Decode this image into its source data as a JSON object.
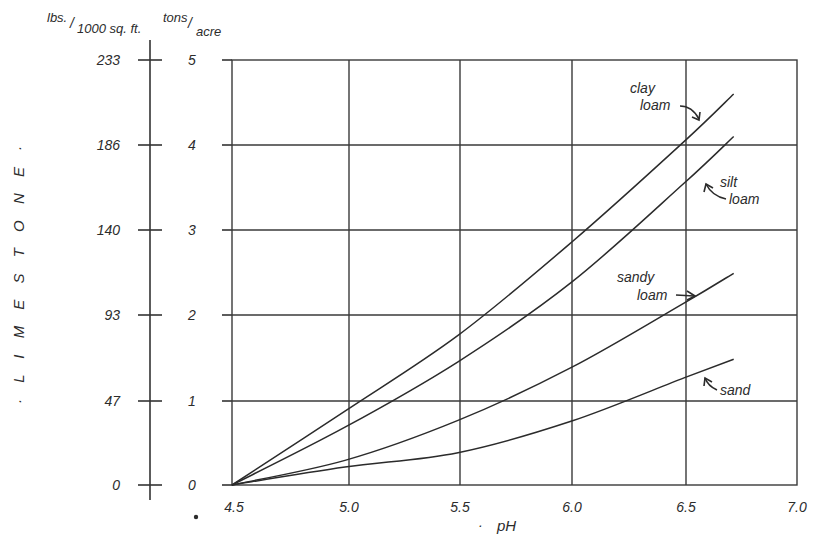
{
  "chart_data": {
    "type": "line",
    "title": "",
    "xlabel": "pH",
    "ylabel": "LIMESTONE",
    "ylabel_display": "· L I M E S T O N E ·",
    "y_axes": [
      {
        "name": "lbs./1000 sq. ft.",
        "label_main": "lbs.",
        "label_sub": "1000 sq. ft.",
        "ticks": [
          0,
          47,
          93,
          140,
          186,
          233
        ]
      },
      {
        "name": "tons/acre",
        "label_main": "tons",
        "label_sub": "acre",
        "ticks": [
          0,
          1,
          2,
          3,
          4,
          5
        ]
      }
    ],
    "xlim": [
      4.5,
      7.0
    ],
    "ylim": [
      0,
      5
    ],
    "x_ticks": [
      "4.5",
      "5.0",
      "5.5",
      "6.0",
      "6.5",
      "7.0"
    ],
    "grid": true,
    "legend": "inline annotations with arrows",
    "x": [
      4.5,
      5.0,
      5.5,
      6.0,
      6.5,
      6.72
    ],
    "series": [
      {
        "name": "clay loam",
        "label_lines": [
          "clay",
          "loam"
        ],
        "values": [
          0,
          0.87,
          1.76,
          2.85,
          4.04,
          4.6
        ]
      },
      {
        "name": "silt loam",
        "label_lines": [
          "silt",
          "loam"
        ],
        "values": [
          0,
          0.68,
          1.45,
          2.38,
          3.55,
          4.1
        ]
      },
      {
        "name": "sandy loam",
        "label_lines": [
          "sandy",
          "loam"
        ],
        "values": [
          0,
          0.29,
          0.76,
          1.38,
          2.14,
          2.49
        ]
      },
      {
        "name": "sand",
        "label_lines": [
          "sand"
        ],
        "values": [
          0,
          0.21,
          0.38,
          0.75,
          1.26,
          1.48
        ]
      }
    ]
  },
  "labels": {
    "lbs_unit_main": "lbs.",
    "lbs_unit_slash": "/",
    "lbs_unit_sub": "1000 sq. ft.",
    "tons_unit_main": "tons",
    "tons_unit_slash": "/",
    "tons_unit_sub": "acre",
    "lbs_ticks": [
      "0",
      "47",
      "93",
      "140",
      "186",
      "233"
    ],
    "tons_ticks": [
      "0",
      "1",
      "2",
      "3",
      "4",
      "5"
    ],
    "x_ticks": [
      "4.5",
      "5.0",
      "5.5",
      "6.0",
      "6.5",
      "7.0"
    ],
    "x_title": "pH",
    "x_title_dot": "·",
    "y_title": "· L I M E S T O N E ·",
    "clay_1": "clay",
    "clay_2": "loam",
    "silt_1": "silt",
    "silt_2": "loam",
    "sandy_1": "sandy",
    "sandy_2": "loam",
    "sand": "sand"
  }
}
